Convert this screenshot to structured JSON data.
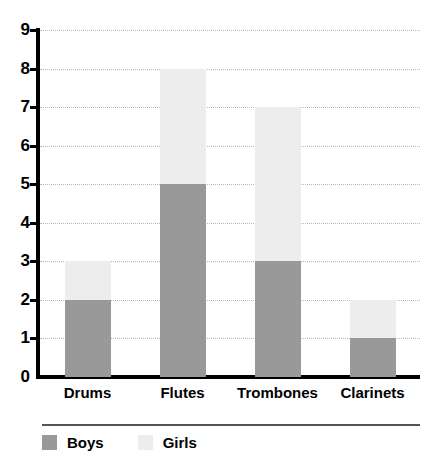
{
  "chart_data": {
    "type": "bar",
    "subtype": "stacked-bar",
    "title": "",
    "xlabel": "",
    "ylabel": "",
    "categories": [
      "Drums",
      "Flutes",
      "Trombones",
      "Clarinets"
    ],
    "series": [
      {
        "name": "Boys",
        "values": [
          2,
          5,
          3,
          1
        ],
        "color": "#999999"
      },
      {
        "name": "Girls",
        "values": [
          1,
          3,
          4,
          1
        ],
        "color": "#ededed"
      }
    ],
    "totals": [
      3,
      8,
      7,
      2
    ],
    "ylim": [
      0,
      9
    ],
    "ytick_labels": [
      "0",
      "1",
      "2",
      "3",
      "4",
      "5",
      "6",
      "7",
      "8",
      "9"
    ],
    "ytick_values": [
      0,
      1,
      2,
      3,
      4,
      5,
      6,
      7,
      8,
      9
    ],
    "grid": "horizontal-dotted",
    "legend_position": "bottom-left",
    "legend_entries": [
      "Boys",
      "Girls"
    ],
    "axis_color": "#000000",
    "grid_color": "#b9b9b9",
    "background": "#ffffff"
  }
}
